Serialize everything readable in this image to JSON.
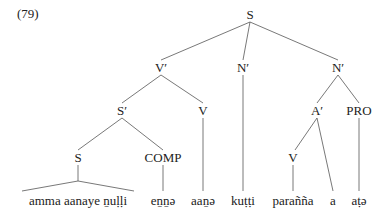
{
  "example_number": "(79)",
  "tree": {
    "root": "S",
    "level1": [
      "V′",
      "N′",
      "N′"
    ],
    "level2": [
      "S′",
      "V",
      "A′",
      "PRO"
    ],
    "level3": [
      "S",
      "COMP",
      "V"
    ],
    "leaves": [
      "amma aanaye ṉuḷḷi",
      "eṉṉə",
      "aaṉə",
      "kuṭṭi",
      "parañña",
      "a",
      "aṭə"
    ]
  },
  "leaves_display": {
    "amma": "amma aanaye ṉuḷḷi",
    "enne": "eṉṉə",
    "aane": "aaṉə",
    "kutti": "kuṭṭi",
    "paranna": "parañña",
    "a": "a",
    "ate": "aṭə"
  }
}
